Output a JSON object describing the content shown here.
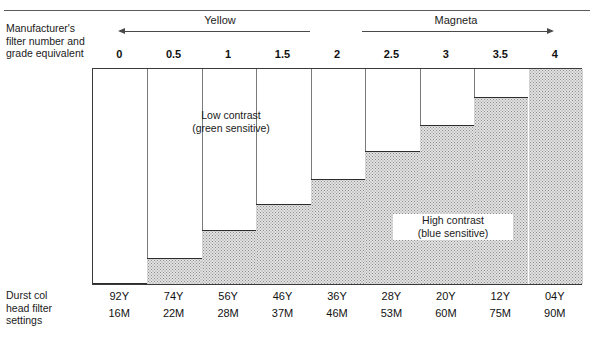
{
  "header": {
    "bands": [
      {
        "name": "Yellow",
        "direction": "left"
      },
      {
        "name": "Magneta",
        "direction": "right"
      }
    ]
  },
  "captions": {
    "manufacturer": "Manufacturer's\nfilter number and\ngrade equivalent",
    "durst": "Durst col\nhead filter\nsettings"
  },
  "annotations": {
    "low_contrast": "Low contrast\n(green sensitive)",
    "high_contrast": "High contrast\n(blue sensitive)"
  },
  "colors": {
    "rule": "#5a5a5a",
    "axis": "#3a3a3a",
    "separator": "#7a7a7a",
    "fill": "#e2e2e2",
    "fill_dot": "#8d8d8d",
    "step_edge": "#2c2c2c",
    "text": "#1a1a1a",
    "background": "#ffffff"
  },
  "chart_data": {
    "type": "bar",
    "title": "",
    "xlabel": "Manufacturer's filter number and grade equivalent",
    "ylabel": "",
    "grid": false,
    "legend": false,
    "categories": [
      "0",
      "0.5",
      "1",
      "1.5",
      "2",
      "2.5",
      "3",
      "3.5",
      "4"
    ],
    "values": [
      0,
      12,
      25,
      37,
      49,
      62,
      74,
      87,
      100
    ],
    "ylim": [
      0,
      100
    ],
    "value_units": "percent of plot height (shaded step height)",
    "series": [
      {
        "name": "Shaded step height (%)",
        "values": [
          0,
          12,
          25,
          37,
          49,
          62,
          74,
          87,
          100
        ]
      }
    ],
    "secondary_axis": {
      "name": "Durst col head filter settings",
      "yellow": [
        "92Y",
        "74Y",
        "56Y",
        "46Y",
        "36Y",
        "28Y",
        "20Y",
        "12Y",
        "04Y"
      ],
      "magenta": [
        "16M",
        "22M",
        "28M",
        "37M",
        "46M",
        "53M",
        "60M",
        "75M",
        "90M"
      ]
    },
    "annotations": [
      {
        "text": "Low contrast (green sensitive)",
        "x_category": "1",
        "position": "upper-left"
      },
      {
        "text": "High contrast (blue sensitive)",
        "x_category": "3",
        "position": "lower-right"
      }
    ],
    "bands": [
      {
        "label": "Yellow",
        "from_category": "0",
        "to_category": "2",
        "arrow": "left"
      },
      {
        "label": "Magneta",
        "from_category": "2.5",
        "to_category": "4",
        "arrow": "right"
      }
    ]
  },
  "table": {
    "rows": [
      {
        "key": "yellow",
        "cells": [
          "92Y",
          "74Y",
          "56Y",
          "46Y",
          "36Y",
          "28Y",
          "20Y",
          "12Y",
          "04Y"
        ]
      },
      {
        "key": "magenta",
        "cells": [
          "16M",
          "22M",
          "28M",
          "37M",
          "46M",
          "53M",
          "60M",
          "75M",
          "90M"
        ]
      }
    ]
  }
}
